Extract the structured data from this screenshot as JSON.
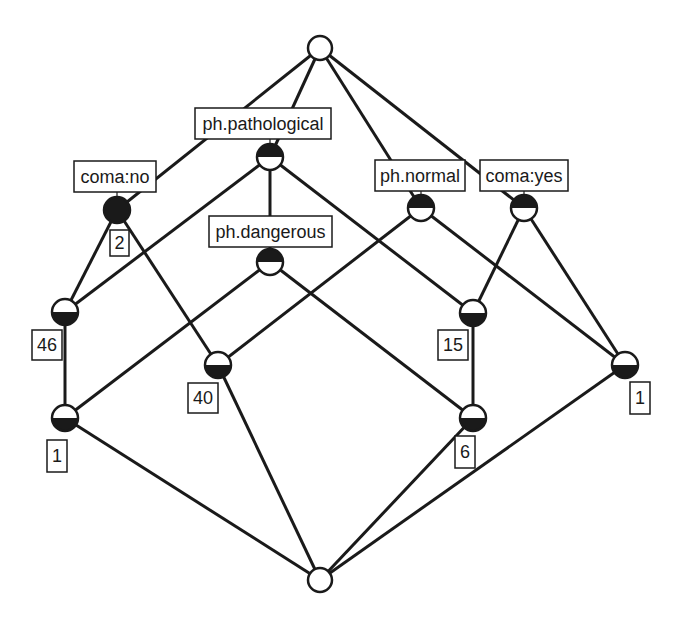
{
  "diagram": {
    "type": "concept-lattice",
    "colors": {
      "stroke": "#1a1a1a",
      "fill_dark": "#1a1a1a",
      "fill_light": "#ffffff"
    },
    "nodes": [
      {
        "id": "top",
        "x": 320,
        "y": 48,
        "r": 12,
        "fill": "empty"
      },
      {
        "id": "coma_no",
        "x": 117,
        "y": 210,
        "r": 13,
        "fill": "full"
      },
      {
        "id": "ph_pathological",
        "x": 270,
        "y": 157,
        "r": 13,
        "fill": "top"
      },
      {
        "id": "ph_dangerous",
        "x": 270,
        "y": 262,
        "r": 13,
        "fill": "top"
      },
      {
        "id": "ph_normal",
        "x": 421,
        "y": 208,
        "r": 13,
        "fill": "top"
      },
      {
        "id": "coma_yes",
        "x": 524,
        "y": 208,
        "r": 13,
        "fill": "top"
      },
      {
        "id": "n46",
        "x": 65,
        "y": 312,
        "r": 13,
        "fill": "bottom"
      },
      {
        "id": "n40",
        "x": 218,
        "y": 365,
        "r": 13,
        "fill": "bottom"
      },
      {
        "id": "n15",
        "x": 473,
        "y": 313,
        "r": 13,
        "fill": "bottom"
      },
      {
        "id": "n1r",
        "x": 625,
        "y": 365,
        "r": 13,
        "fill": "bottom"
      },
      {
        "id": "n1l",
        "x": 65,
        "y": 418,
        "r": 13,
        "fill": "bottom"
      },
      {
        "id": "n6",
        "x": 473,
        "y": 418,
        "r": 13,
        "fill": "bottom"
      },
      {
        "id": "bottom",
        "x": 320,
        "y": 580,
        "r": 12,
        "fill": "empty"
      }
    ],
    "edges": [
      [
        "top",
        "coma_no"
      ],
      [
        "top",
        "ph_pathological"
      ],
      [
        "top",
        "ph_normal"
      ],
      [
        "top",
        "coma_yes"
      ],
      [
        "coma_no",
        "n46"
      ],
      [
        "coma_no",
        "n40"
      ],
      [
        "ph_pathological",
        "n46"
      ],
      [
        "ph_pathological",
        "ph_dangerous"
      ],
      [
        "ph_pathological",
        "n15"
      ],
      [
        "ph_dangerous",
        "n1l"
      ],
      [
        "ph_dangerous",
        "n6"
      ],
      [
        "ph_normal",
        "n40"
      ],
      [
        "ph_normal",
        "n1r"
      ],
      [
        "coma_yes",
        "n15"
      ],
      [
        "coma_yes",
        "n1r"
      ],
      [
        "n46",
        "n1l"
      ],
      [
        "n15",
        "n6"
      ],
      [
        "n1l",
        "bottom"
      ],
      [
        "n40",
        "bottom"
      ],
      [
        "n6",
        "bottom"
      ],
      [
        "n1r",
        "bottom"
      ]
    ],
    "attribute_labels": [
      {
        "node": "coma_no",
        "text": "coma:no",
        "x": 74,
        "y": 161,
        "w": 82,
        "h": 31
      },
      {
        "node": "ph_pathological",
        "text": "ph.pathological",
        "x": 195,
        "y": 108,
        "w": 136,
        "h": 31
      },
      {
        "node": "ph_dangerous",
        "text": "ph.dangerous",
        "x": 209,
        "y": 216,
        "w": 123,
        "h": 31
      },
      {
        "node": "ph_normal",
        "text": "ph.normal",
        "x": 375,
        "y": 160,
        "w": 90,
        "h": 31
      },
      {
        "node": "coma_yes",
        "text": "coma:yes",
        "x": 480,
        "y": 160,
        "w": 88,
        "h": 31
      }
    ],
    "object_counts": [
      {
        "node": "coma_no",
        "text": "2",
        "x": 110,
        "y": 230,
        "w": 19,
        "h": 26
      },
      {
        "node": "n46",
        "text": "46",
        "x": 32,
        "y": 330,
        "w": 30,
        "h": 30
      },
      {
        "node": "n40",
        "text": "40",
        "x": 188,
        "y": 383,
        "w": 30,
        "h": 30
      },
      {
        "node": "n15",
        "text": "15",
        "x": 438,
        "y": 330,
        "w": 30,
        "h": 30
      },
      {
        "node": "n1r",
        "text": "1",
        "x": 630,
        "y": 382,
        "w": 20,
        "h": 32
      },
      {
        "node": "n1l",
        "text": "1",
        "x": 47,
        "y": 440,
        "w": 20,
        "h": 32
      },
      {
        "node": "n6",
        "text": "6",
        "x": 455,
        "y": 436,
        "w": 20,
        "h": 32
      }
    ]
  }
}
